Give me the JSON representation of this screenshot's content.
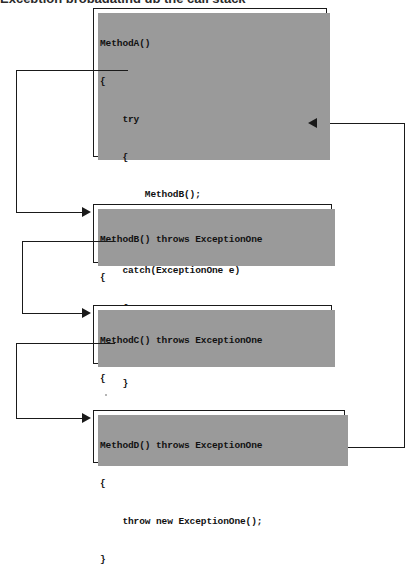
{
  "figure": {
    "clipped_caption": "Exception propagating up the call stack",
    "boxes": [
      {
        "id": "method-a",
        "name": "MethodA",
        "lines": [
          "MethodA()",
          "{",
          "    try",
          "    {",
          "        MethodB();",
          "    }",
          "    catch(ExceptionOne e)",
          "    {",
          "        // handle exception here",
          "    }",
          "}"
        ]
      },
      {
        "id": "method-b",
        "name": "MethodB",
        "lines": [
          "MethodB() throws ExceptionOne",
          "{",
          "    MethodC();",
          "}"
        ]
      },
      {
        "id": "method-c",
        "name": "MethodC",
        "lines": [
          "MethodC() throws ExceptionOne",
          "{",
          "    MethodD();",
          "}"
        ]
      },
      {
        "id": "method-d",
        "name": "MethodD",
        "lines": [
          "MethodD() throws ExceptionOne",
          "{",
          "    throw new ExceptionOne();",
          "}"
        ]
      }
    ],
    "connectors": [
      {
        "id": "call-a-to-b",
        "from": "MethodA: MethodB();",
        "to": "MethodB() throws ExceptionOne",
        "direction": "down-left-then-right"
      },
      {
        "id": "call-b-to-c",
        "from": "MethodB: MethodC();",
        "to": "MethodC() throws ExceptionOne",
        "direction": "down-left-then-right"
      },
      {
        "id": "call-c-to-d",
        "from": "MethodC: MethodD();",
        "to": "MethodD() throws ExceptionOne",
        "direction": "down-left-then-right"
      },
      {
        "id": "throw-d-to-catch-a",
        "from": "MethodD: throw new ExceptionOne();",
        "to": "MethodA: // handle exception here",
        "direction": "right-then-up-then-left"
      }
    ],
    "colors": {
      "line": "#1a1a1a",
      "box_border": "#1a1a1a",
      "box_fill": "#ffffff",
      "shadow": "#9a9a9a",
      "text": "#111111"
    }
  }
}
